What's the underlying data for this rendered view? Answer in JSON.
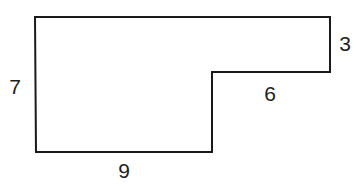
{
  "diagram": {
    "type": "rectilinear-polygon",
    "stroke_color": "#1a1a1a",
    "label_color": "#1e1e1e",
    "background": "#ffffff",
    "vertices": [
      {
        "x": 35,
        "y": 17
      },
      {
        "x": 330,
        "y": 17
      },
      {
        "x": 330,
        "y": 72
      },
      {
        "x": 212,
        "y": 72
      },
      {
        "x": 212,
        "y": 152
      },
      {
        "x": 36,
        "y": 152
      }
    ],
    "labels": {
      "left_side": {
        "text": "7",
        "x": 15,
        "y": 94
      },
      "right_side": {
        "text": "3",
        "x": 345,
        "y": 51
      },
      "inner_top": {
        "text": "6",
        "x": 270,
        "y": 101
      },
      "bottom_side": {
        "text": "9",
        "x": 124,
        "y": 178
      }
    }
  }
}
